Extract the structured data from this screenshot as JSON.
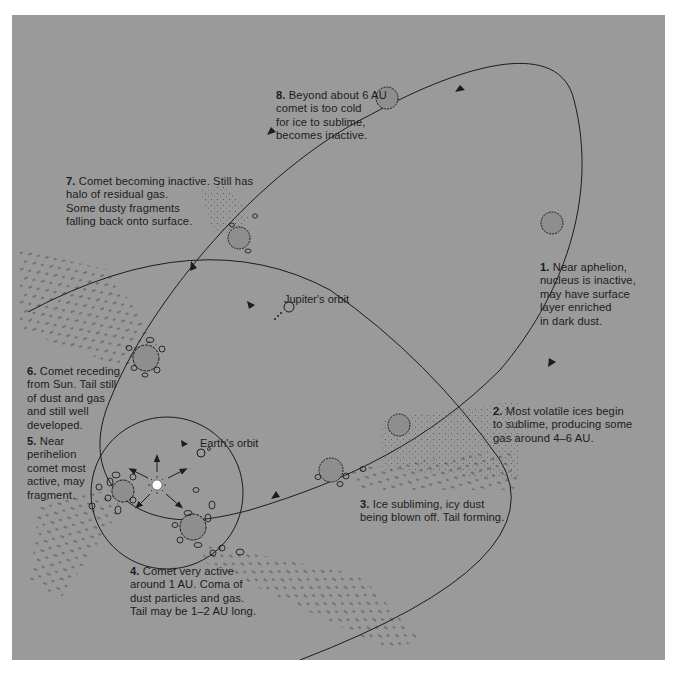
{
  "diagram": {
    "colors": {
      "background": "#9a9a9a",
      "page": "#ffffff",
      "ink": "#1c1c1c",
      "sun": "#ffffff"
    },
    "orbit_labels": {
      "jupiter": "Jupiter's orbit",
      "earth": "Earth's orbit"
    },
    "stages": [
      {
        "num": "1.",
        "text": "Near aphelion,\nnucleus is inactive,\nmay have surface\nlayer enriched\nin dark dust."
      },
      {
        "num": "2.",
        "text": "Most volatile ices begin\nto sublime, producing some\ngas around 4–6 AU."
      },
      {
        "num": "3.",
        "text": "Ice subliming, icy dust\nbeing blown off. Tail forming."
      },
      {
        "num": "4.",
        "text": "Comet very active\naround 1 AU. Coma of\ndust particles and gas.\nTail may be 1–2 AU long."
      },
      {
        "num": "5.",
        "text": "Near\nperihelion\ncomet most\nactive, may\nfragment."
      },
      {
        "num": "6.",
        "text": "Comet receding\nfrom Sun. Tail still\nof dust and gas\nand still well\ndeveloped."
      },
      {
        "num": "7.",
        "text": "Comet becoming inactive. Still has\nhalo of residual gas.\nSome dusty fragments\nfalling back onto surface."
      },
      {
        "num": "8.",
        "text": "Beyond about 6 AU\ncomet is too cold\nfor ice to sublime,\nbecomes inactive."
      }
    ]
  }
}
